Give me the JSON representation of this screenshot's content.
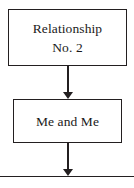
{
  "diagram": {
    "type": "flowchart",
    "orientation": "top-to-bottom",
    "background_color": "#ffffff",
    "line_color": "#231f20",
    "text_color": "#1a1a1a",
    "nodes": [
      {
        "id": "relationship",
        "label_line1": "Relationship",
        "label_line2": "No. 2",
        "shape": "rectangle"
      },
      {
        "id": "me-and-me",
        "label_line1": "Me and Me",
        "shape": "rectangle"
      },
      {
        "id": "next-cropped",
        "label_line1": "",
        "shape": "rectangle"
      }
    ],
    "connectors": [
      {
        "id": "connector-1",
        "from": "relationship",
        "to": "me-and-me",
        "arrowhead": "solid-triangle-down"
      },
      {
        "id": "connector-2",
        "from": "me-and-me",
        "to": "next-cropped",
        "arrowhead": "solid-triangle-down"
      }
    ]
  }
}
